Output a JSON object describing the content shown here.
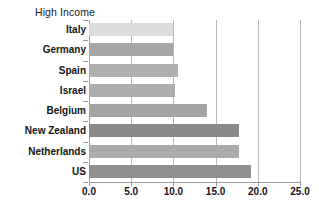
{
  "chart_data": {
    "type": "bar",
    "orientation": "horizontal",
    "title": "High Income",
    "xlabel": "",
    "ylabel": "",
    "categories": [
      "Italy",
      "Germany",
      "Spain",
      "Israel",
      "Belgium",
      "New Zealand",
      "Netherlands",
      "US"
    ],
    "values": [
      10.0,
      10.0,
      10.6,
      10.2,
      14.0,
      17.8,
      17.8,
      19.2
    ],
    "bar_colors": [
      "#dcdcdc",
      "#a6a6a6",
      "#b0b0b0",
      "#aeaeae",
      "#a4a4a4",
      "#8a8a8a",
      "#ababab",
      "#8f8f8f"
    ],
    "xlim": [
      0.0,
      25.0
    ],
    "xticks": [
      0.0,
      5.0,
      10.0,
      15.0,
      20.0,
      25.0
    ],
    "xtick_labels": [
      "0.0",
      "5.0",
      "10.0",
      "15.0",
      "20.0",
      "25.0"
    ],
    "grid": true,
    "grid_axis": "x",
    "legend": false,
    "legend_position": "none",
    "grid_color": "#b9b9b9",
    "axis_color": "#9a9a9a",
    "text_color": "#141414"
  }
}
